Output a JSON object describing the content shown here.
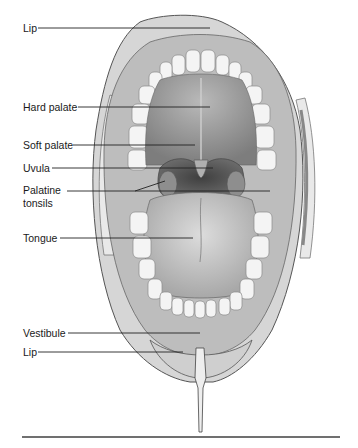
{
  "figure": {
    "labels": [
      {
        "id": "lip-upper",
        "text": "Lip",
        "x": 23,
        "y": 22,
        "line": [
          [
            38,
            28
          ],
          [
            210,
            28
          ]
        ]
      },
      {
        "id": "hard-palate",
        "text": "Hard palate",
        "x": 23,
        "y": 101,
        "line": [
          [
            78,
            107
          ],
          [
            210,
            107
          ]
        ]
      },
      {
        "id": "soft-palate",
        "text": "Soft palate",
        "x": 23,
        "y": 139,
        "line": [
          [
            73,
            145
          ],
          [
            195,
            145
          ]
        ]
      },
      {
        "id": "uvula",
        "text": "Uvula",
        "x": 23,
        "y": 162,
        "line": [
          [
            52,
            168
          ],
          [
            213,
            168
          ]
        ]
      },
      {
        "id": "palatine-tonsils-1",
        "text": "Palatine",
        "x": 23,
        "y": 184,
        "line": [
          [
            67,
            191
          ],
          [
            165,
            191
          ]
        ]
      },
      {
        "id": "palatine-tonsils-2",
        "text": "tonsils",
        "x": 23,
        "y": 197
      },
      {
        "id": "tongue",
        "text": "Tongue",
        "x": 23,
        "y": 232,
        "line": [
          [
            60,
            238
          ],
          [
            193,
            238
          ]
        ]
      },
      {
        "id": "vestibule",
        "text": "Vestibule",
        "x": 23,
        "y": 327,
        "line": [
          [
            68,
            333
          ],
          [
            200,
            333
          ]
        ]
      },
      {
        "id": "lip-lower",
        "text": "Lip",
        "x": 23,
        "y": 346,
        "line": [
          [
            38,
            352
          ],
          [
            183,
            352
          ]
        ]
      }
    ],
    "tonsil_pointers": [
      [
        [
          135,
          191
        ],
        [
          165,
          181
        ]
      ],
      [
        [
          135,
          191
        ],
        [
          270,
          191
        ]
      ]
    ],
    "colors": {
      "text": "#1a1a1a",
      "leader": "#222222",
      "rule": "#707070",
      "lip": "#cfcfcf",
      "gum": "#bdbdbd",
      "palate": "#9a9a9a",
      "throat": "#5a5a5a",
      "tongue": "#c9c9c9",
      "teeth": "#f4f4f4"
    },
    "bottom_rule": {
      "x1": 22,
      "x2": 340,
      "y": 437
    }
  }
}
